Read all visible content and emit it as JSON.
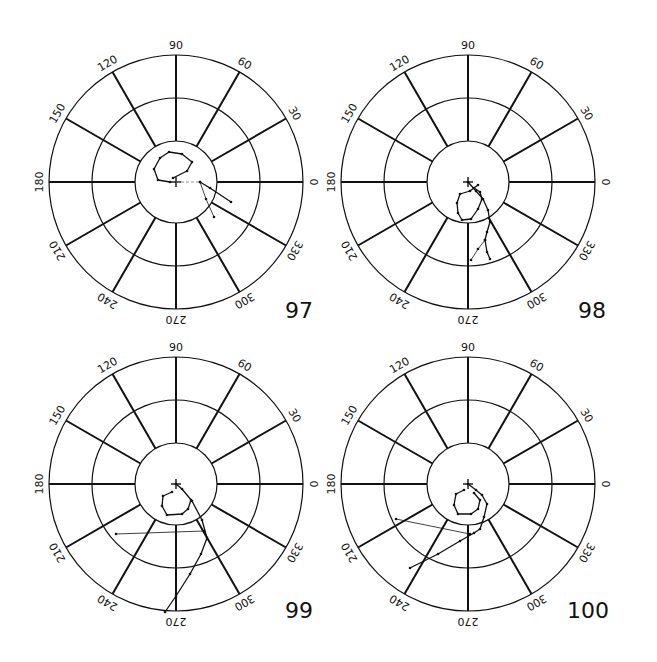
{
  "figure": {
    "background": "#ffffff",
    "ink": "#111111",
    "radii": [
      41,
      84,
      127
    ],
    "angle_labels": [
      "0",
      "30",
      "60",
      "90",
      "120",
      "150",
      "180",
      "210",
      "240",
      "270",
      "300",
      "330"
    ]
  },
  "plots": [
    {
      "label": "97",
      "center": [
        176,
        182
      ],
      "label_pos": [
        285,
        312
      ],
      "traces": [
        {
          "type": "polyline",
          "points": [
            [
              -6,
              0
            ],
            [
              -18,
              -2
            ],
            [
              -22,
              -13
            ],
            [
              -16,
              -24
            ],
            [
              -7,
              -30
            ],
            [
              6,
              -28
            ],
            [
              16,
              -20
            ],
            [
              11,
              -11
            ],
            [
              -3,
              -4
            ]
          ]
        },
        {
          "type": "polyline",
          "points": [
            [
              24,
              0
            ],
            [
              34,
              6
            ],
            [
              55,
              20
            ]
          ]
        },
        {
          "type": "polyline",
          "points": [
            [
              24,
              0
            ],
            [
              30,
              17
            ],
            [
              38,
              35
            ]
          ],
          "thin": true
        },
        {
          "type": "dashed",
          "points": [
            [
              0,
              0
            ],
            [
              24,
              0
            ]
          ]
        }
      ]
    },
    {
      "label": "98",
      "center": [
        468,
        182
      ],
      "label_pos": [
        578,
        312
      ],
      "traces": [
        {
          "type": "polyline",
          "points": [
            [
              0,
              0
            ],
            [
              8,
              9
            ],
            [
              15,
              17
            ],
            [
              20,
              28
            ],
            [
              22,
              40
            ],
            [
              19,
              50
            ],
            [
              17,
              58
            ],
            [
              19,
              70
            ],
            [
              22,
              77
            ]
          ]
        },
        {
          "type": "polyline",
          "points": [
            [
              17,
              58
            ],
            [
              10,
              67
            ],
            [
              3,
              78
            ]
          ],
          "thin": true
        },
        {
          "type": "polyline",
          "points": [
            [
              10,
              3
            ],
            [
              2,
              9
            ],
            [
              -8,
              12
            ],
            [
              -11,
              21
            ],
            [
              -10,
              31
            ],
            [
              -6,
              38
            ],
            [
              3,
              37
            ],
            [
              10,
              27
            ],
            [
              14,
              17
            ],
            [
              12,
              10
            ],
            [
              6,
              6
            ]
          ]
        }
      ]
    },
    {
      "label": "99",
      "center": [
        176,
        484
      ],
      "label_pos": [
        285,
        612
      ],
      "traces": [
        {
          "type": "polyline",
          "points": [
            [
              0,
              0
            ],
            [
              6,
              5
            ],
            [
              16,
              17
            ],
            [
              26,
              36
            ],
            [
              31,
              54
            ],
            [
              25,
              70
            ],
            [
              14,
              90
            ],
            [
              0,
              112
            ],
            [
              -11,
              128
            ]
          ]
        },
        {
          "type": "polyline",
          "points": [
            [
              -4,
              8
            ],
            [
              -13,
              12
            ],
            [
              -14,
              22
            ],
            [
              -9,
              31
            ],
            [
              6,
              30
            ],
            [
              12,
              25
            ],
            [
              15,
              16
            ]
          ]
        },
        {
          "type": "polyline",
          "points": [
            [
              28,
              47
            ],
            [
              -60,
              50
            ]
          ],
          "thin": true
        }
      ]
    },
    {
      "label": "100",
      "center": [
        468,
        484
      ],
      "label_pos": [
        567,
        612
      ],
      "traces": [
        {
          "type": "polyline",
          "points": [
            [
              0,
              0
            ],
            [
              8,
              6
            ],
            [
              14,
              11
            ],
            [
              19,
              20
            ],
            [
              16,
              33
            ],
            [
              12,
              45
            ],
            [
              6,
              49
            ],
            [
              -8,
              57
            ],
            [
              -30,
              70
            ],
            [
              -58,
              84
            ]
          ]
        },
        {
          "type": "polyline",
          "points": [
            [
              -4,
              6
            ],
            [
              -12,
              10
            ],
            [
              -14,
              21
            ],
            [
              -10,
              30
            ],
            [
              3,
              30
            ],
            [
              10,
              25
            ],
            [
              12,
              16
            ],
            [
              6,
              9
            ]
          ]
        },
        {
          "type": "polyline",
          "points": [
            [
              2,
              50
            ],
            [
              -72,
              35
            ]
          ],
          "thin": true
        }
      ]
    }
  ],
  "chart_data": [
    {
      "type": "polar",
      "title": "97",
      "angular_ticks": [
        0,
        30,
        60,
        90,
        120,
        150,
        180,
        210,
        240,
        270,
        300,
        330
      ],
      "radial_rings": 3,
      "grid": true
    },
    {
      "type": "polar",
      "title": "98",
      "angular_ticks": [
        0,
        30,
        60,
        90,
        120,
        150,
        180,
        210,
        240,
        270,
        300,
        330
      ],
      "radial_rings": 3,
      "grid": true
    },
    {
      "type": "polar",
      "title": "99",
      "angular_ticks": [
        0,
        30,
        60,
        90,
        120,
        150,
        180,
        210,
        240,
        270,
        300,
        330
      ],
      "radial_rings": 3,
      "grid": true
    },
    {
      "type": "polar",
      "title": "100",
      "angular_ticks": [
        0,
        30,
        60,
        90,
        120,
        150,
        180,
        210,
        240,
        270,
        300,
        330
      ],
      "radial_rings": 3,
      "grid": true
    }
  ]
}
